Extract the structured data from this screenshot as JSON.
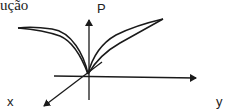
{
  "caption": "ução",
  "axes": {
    "vertical_label": "P",
    "horizontal_label": "y",
    "depth_label": "x"
  },
  "colors": {
    "stroke": "#1a1a1a",
    "background": "#ffffff"
  }
}
